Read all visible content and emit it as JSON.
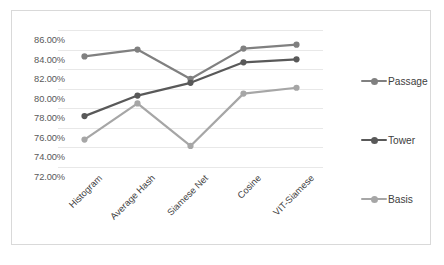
{
  "chart_data": {
    "type": "line",
    "title": "",
    "subtitle": "",
    "xlabel": "",
    "ylabel": "",
    "categories": [
      "Histogram",
      "Average Hash",
      "Siamese Net",
      "Cosine",
      "VIT-Siamese"
    ],
    "series": [
      {
        "name": "Passage",
        "color": "#808080",
        "values": [
          83.3,
          84.0,
          81.0,
          84.1,
          84.5
        ]
      },
      {
        "name": "Tower",
        "color": "#595959",
        "values": [
          77.2,
          79.3,
          80.6,
          82.7,
          83.0
        ]
      },
      {
        "name": "Basis",
        "color": "#a6a6a6",
        "values": [
          74.8,
          78.5,
          74.15,
          79.5,
          80.1
        ]
      }
    ],
    "ylim": [
      72.0,
      86.0
    ],
    "ytick_step": 2.0,
    "ytick_labels": [
      "86.00%",
      "84.00%",
      "82.00%",
      "80.00%",
      "78.00%",
      "76.00%",
      "74.00%",
      "72.00%"
    ],
    "ytick_values": [
      86.0,
      84.0,
      82.0,
      80.0,
      78.0,
      76.0,
      74.0,
      72.0
    ],
    "value_suffix": "%",
    "grid": true,
    "grid_color": "#e8e8e8",
    "legend_position": "right",
    "legend": [
      "Passage",
      "Tower",
      "Basis"
    ],
    "border_color": "#d9d9d9",
    "background": "#ffffff",
    "xlabel_rotation": -45
  }
}
